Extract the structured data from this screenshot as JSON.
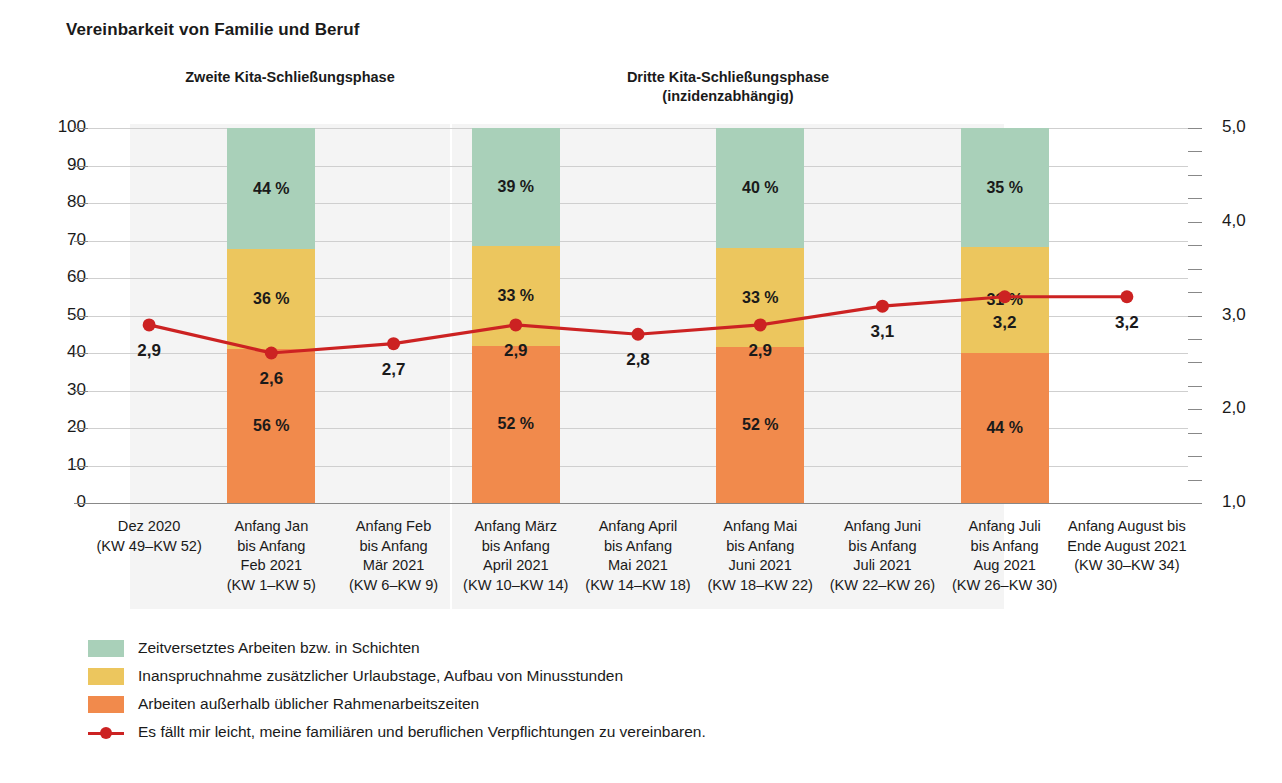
{
  "title": "Vereinbarkeit von Familie und Beruf",
  "phases": [
    {
      "label": "Zweite Kita-Schließungsphase"
    },
    {
      "label": "Dritte Kita-Schließungsphase\n(inzidenzabhängig)"
    }
  ],
  "axis_left": {
    "ticks": [
      "100",
      "90",
      "80",
      "70",
      "60",
      "50",
      "40",
      "30",
      "20",
      "10",
      "0"
    ],
    "min": 0,
    "max": 100
  },
  "axis_right": {
    "ticks": [
      "5,0",
      "4,0",
      "3,0",
      "2,0",
      "1,0"
    ],
    "min": 1.0,
    "max": 5.0
  },
  "legend": [
    {
      "name": "green-swatch",
      "color": "#a9d0b9",
      "label": "Zeitversetztes Arbeiten bzw. in Schichten"
    },
    {
      "name": "yellow-swatch",
      "color": "#ecc65e",
      "label": "Inanspruchnahme zusätzlicher Urlaubstage, Aufbau von Minusstunden"
    },
    {
      "name": "orange-swatch",
      "color": "#f18a4c",
      "label": "Arbeiten außerhalb üblicher Rahmenarbeitszeiten"
    },
    {
      "name": "line-marker",
      "color": "#cc2222",
      "label": "Es fällt mir leicht, meine familiären und beruflichen Verpflichtungen zu vereinbaren."
    }
  ],
  "chart_data": {
    "type": "bar",
    "title": "Vereinbarkeit von Familie und Beruf",
    "xlabel": "",
    "ylabel": "",
    "ylim": [
      0,
      100
    ],
    "y2lim": [
      1.0,
      5.0
    ],
    "grid": true,
    "legend_position": "bottom-left",
    "categories": [
      "Dez 2020\n(KW 49–KW 52)",
      "Anfang Jan\nbis Anfang\nFeb 2021\n(KW 1–KW 5)",
      "Anfang Feb\nbis Anfang\nMär 2021\n(KW 6–KW 9)",
      "Anfang März\nbis Anfang\nApril 2021\n(KW 10–KW 14)",
      "Anfang April\nbis Anfang\nMai 2021\n(KW 14–KW 18)",
      "Anfang Mai\nbis Anfang\nJuni 2021\n(KW 18–KW 22)",
      "Anfang Juni\nbis Anfang\nJuli 2021\n(KW 22–KW 26)",
      "Anfang Juli\nbis Anfang\nAug 2021\n(KW 26–KW 30)",
      "Anfang August bis\nEnde August 2021\n(KW 30–KW 34)"
    ],
    "series": [
      {
        "name": "Arbeiten außerhalb üblicher Rahmenarbeitszeiten",
        "color": "#f18a4c",
        "values": [
          null,
          56,
          null,
          52,
          null,
          52,
          null,
          44,
          null
        ],
        "labels": [
          null,
          "56 %",
          null,
          "52 %",
          null,
          "52 %",
          null,
          "44 %",
          null
        ]
      },
      {
        "name": "Inanspruchnahme zusätzlicher Urlaubstage, Aufbau von Minusstunden",
        "color": "#ecc65e",
        "values": [
          null,
          36,
          null,
          33,
          null,
          33,
          null,
          31,
          null
        ],
        "labels": [
          null,
          "36 %",
          null,
          "33 %",
          null,
          "33 %",
          null,
          "31 %",
          null
        ]
      },
      {
        "name": "Zeitversetztes Arbeiten bzw. in Schichten",
        "color": "#a9d0b9",
        "values": [
          null,
          44,
          null,
          39,
          null,
          40,
          null,
          35,
          null
        ],
        "labels": [
          null,
          "44 %",
          null,
          "39 %",
          null,
          "40 %",
          null,
          "35 %",
          null
        ]
      }
    ],
    "line_series": {
      "name": "Es fällt mir leicht, meine familiären und beruflichen Verpflichtungen zu vereinbaren.",
      "color": "#cc2222",
      "axis": "right",
      "values": [
        2.9,
        2.6,
        2.7,
        2.9,
        2.8,
        2.9,
        3.1,
        3.2,
        3.2
      ],
      "labels": [
        "2,9",
        "2,6",
        "2,7",
        "2,9",
        "2,8",
        "2,9",
        "3,1",
        "3,2",
        "3,2"
      ]
    }
  }
}
